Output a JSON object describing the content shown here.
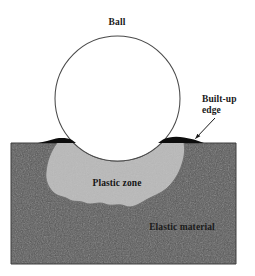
{
  "figure": {
    "background_color": "#ffffff",
    "width": 255,
    "height": 276
  },
  "labels": {
    "ball": "Ball",
    "built_up_edge_line1": "Built-up",
    "built_up_edge_line2": "edge",
    "plastic_zone": "Plastic zone",
    "elastic_material": "Elastic material"
  },
  "colors": {
    "ball_fill": "#ffffff",
    "ball_stroke": "#4a4a4a",
    "plastic_zone_fill": "#b9b9b9",
    "plastic_zone_stroke": "#6e6e6e",
    "elastic_material_fill": "#585858",
    "elastic_material_stroke": "#3d3d3d",
    "built_up_edge_fill": "#0d0d0d",
    "leader_line": "#1a1a1a",
    "label_text": "#1a1a1a"
  },
  "geometry": {
    "ball": {
      "cx": 117.5,
      "cy": 98.5,
      "r": 62.5
    },
    "block": {
      "left": 11,
      "right": 236,
      "top": 143,
      "bottom": 264
    },
    "plastic_zone_depth": 205,
    "built_up_edge_left": {
      "x_start": 47,
      "x_end": 77
    },
    "built_up_edge_right": {
      "x_start": 158,
      "x_end": 202
    },
    "arrow": {
      "from_x": 214,
      "from_y": 120,
      "to_x": 194,
      "to_y": 139
    }
  },
  "label_positions": {
    "ball": {
      "x": 117,
      "y": 25
    },
    "built_up_edge": {
      "x": 203,
      "y": 104
    },
    "plastic_zone": {
      "x": 117,
      "y": 185
    },
    "elastic_material": {
      "x": 182,
      "y": 229
    }
  }
}
